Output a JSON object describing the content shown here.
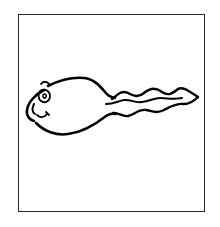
{
  "illustration": {
    "subject": "cartoon sperm / tadpole with smiling face",
    "style": "black line drawing on white",
    "colors": {
      "background": "#ffffff",
      "line": "#000000",
      "frame": "#2a2a2a"
    },
    "frame": {
      "left": 18,
      "top": 14,
      "right": 205,
      "bottom": 212
    }
  }
}
